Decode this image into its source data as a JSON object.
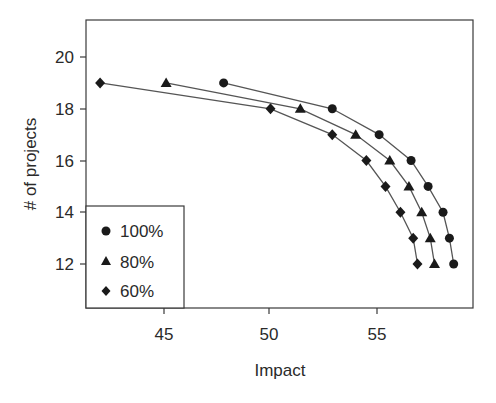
{
  "chart_data": {
    "type": "line",
    "title": "",
    "xlabel": "Impact",
    "ylabel": "# of projects",
    "xlim": [
      41.5,
      59.4
    ],
    "ylim": [
      10.3,
      21.4
    ],
    "xticks": [
      45,
      50,
      55
    ],
    "yticks": [
      12,
      14,
      16,
      18,
      20
    ],
    "grid": false,
    "legend_position": "lower left",
    "series": [
      {
        "name": "100%",
        "marker": "circle",
        "x": [
          47.8,
          52.9,
          55.1,
          56.6,
          57.4,
          58.1,
          58.4,
          58.6
        ],
        "y": [
          19,
          18,
          17,
          16,
          15,
          14,
          13,
          12
        ]
      },
      {
        "name": "80%",
        "marker": "triangle",
        "x": [
          45.1,
          51.4,
          54.0,
          55.6,
          56.5,
          57.1,
          57.5,
          57.7
        ],
        "y": [
          19,
          18,
          17,
          16,
          15,
          14,
          13,
          12
        ]
      },
      {
        "name": "60%",
        "marker": "diamond",
        "x": [
          42.0,
          50.0,
          52.9,
          54.5,
          55.4,
          56.1,
          56.7,
          56.9
        ],
        "y": [
          19,
          18,
          17,
          16,
          15,
          14,
          13,
          12
        ]
      }
    ]
  },
  "axes": {
    "x_title": "Impact",
    "y_title": "# of projects",
    "x_tick_labels": [
      "45",
      "50",
      "55"
    ],
    "y_tick_labels": [
      "12",
      "14",
      "16",
      "18",
      "20"
    ]
  },
  "legend": {
    "items": [
      {
        "label": "100%",
        "marker": "circle-icon"
      },
      {
        "label": "80%",
        "marker": "triangle-icon"
      },
      {
        "label": "60%",
        "marker": "diamond-icon"
      }
    ]
  },
  "colors": {
    "marker": "#1a1a1a",
    "line": "#555555",
    "axis": "#3a3a3a",
    "text": "#2a2a2a"
  }
}
